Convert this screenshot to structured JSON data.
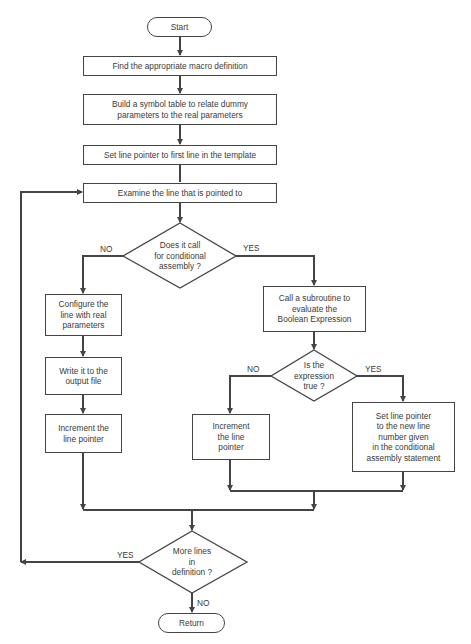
{
  "flowchart": {
    "start": "Start",
    "steps": {
      "find_macro": "Find the appropriate macro definition",
      "build_table": "Build a symbol table to relate dummy\nparameters to the real parameters",
      "set_pointer": "Set line pointer to first line in the template",
      "examine": "Examine the line that is pointed to",
      "configure": "Configure the\nline with real\nparameters",
      "write_output": "Write it to the\noutput file",
      "increment_left": "Increment the\nline pointer",
      "call_subroutine": "Call a subroutine to\nevaluate the\nBoolean Expression",
      "increment_mid": "Increment\nthe line\npointer",
      "set_new_line": "Set line pointer\nto the new line\nnumber given\nin the conditional\nassembly statement"
    },
    "decisions": {
      "conditional": "Does it call\nfor conditional\nassembly ?",
      "expression_true": "Is the\nexpression\ntrue ?",
      "more_lines": "More lines\nin\ndefinition ?"
    },
    "labels": {
      "d1_no": "NO",
      "d1_yes": "YES",
      "d2_no": "NO",
      "d2_yes": "YES",
      "d3_yes": "YES",
      "d3_no": "NO"
    },
    "end": "Return"
  },
  "colors": {
    "line": "#444444",
    "background": "#ffffff",
    "text": "#3a3a3a"
  }
}
